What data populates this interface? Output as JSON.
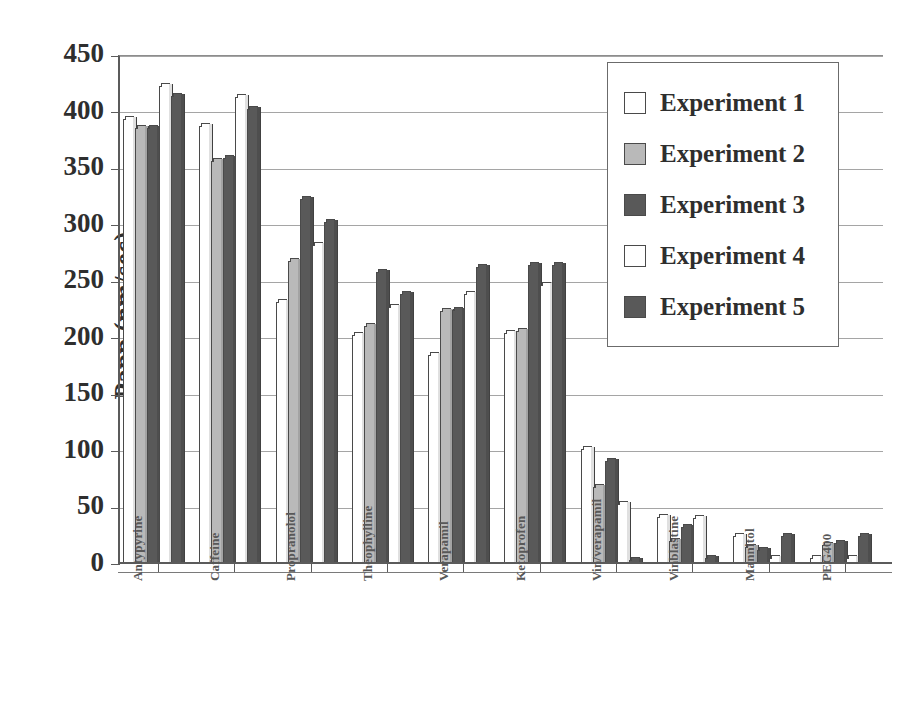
{
  "chart_data": {
    "type": "bar",
    "title": "",
    "xlabel": "",
    "ylabel": "Papp (nm/sec)",
    "ylim": [
      0,
      450
    ],
    "ytick_values": [
      0,
      50,
      100,
      150,
      200,
      250,
      300,
      350,
      400,
      450
    ],
    "ytick_labels": [
      "0",
      "50",
      "100",
      "150",
      "200",
      "250",
      "300",
      "350",
      "400",
      "450"
    ],
    "grid": true,
    "legend_position": "top-right",
    "categories": [
      "Antypyrine",
      "Caffeine",
      "Propranolol",
      "Theophylline",
      "Verapamil",
      "Ketoprofen",
      "Vin/verapamil",
      "Vinblastine",
      "Mannitol",
      "PEG400"
    ],
    "series": [
      {
        "name": "Experiment 1",
        "color": "#ffffff",
        "values": [
          394,
          388,
          232,
          203,
          185,
          205,
          102,
          42,
          25,
          5
        ]
      },
      {
        "name": "Experiment 2",
        "color": "#b9b9b9",
        "values": [
          386,
          357,
          268,
          211,
          224,
          206,
          68,
          20,
          15,
          17
        ]
      },
      {
        "name": "Experiment 3",
        "color": "#595959",
        "values": [
          386,
          360,
          323,
          259,
          225,
          265,
          91,
          33,
          12,
          19
        ]
      },
      {
        "name": "Experiment 4",
        "color": "#ffffff",
        "values": [
          423,
          414,
          283,
          228,
          239,
          247,
          53,
          41,
          5,
          5
        ]
      },
      {
        "name": "Experiment 5",
        "color": "#595959",
        "values": [
          415,
          403,
          303,
          239,
          263,
          265,
          4,
          5,
          25,
          25
        ]
      }
    ]
  },
  "legend": {
    "items": [
      {
        "label": "Experiment 1",
        "color": "#ffffff"
      },
      {
        "label": "Experiment 2",
        "color": "#b9b9b9"
      },
      {
        "label": "Experiment 3",
        "color": "#595959"
      },
      {
        "label": "Experiment 4",
        "color": "#ffffff"
      },
      {
        "label": "Experiment 5",
        "color": "#595959"
      }
    ]
  }
}
